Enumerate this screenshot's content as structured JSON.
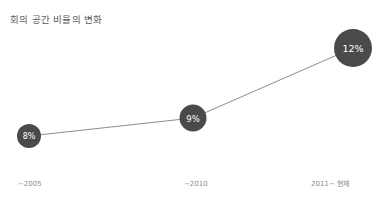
{
  "chart_data": {
    "type": "line",
    "title": "회의 공간 비율의 변화",
    "xlabel": "",
    "ylabel": "",
    "categories": [
      "~2005",
      "~2010",
      "2011~ 현재"
    ],
    "values": [
      8,
      9,
      12
    ],
    "value_labels": [
      "8%",
      "9%",
      "12%"
    ],
    "ylim": [
      0,
      14
    ],
    "grid": false,
    "legend": "none",
    "series": [
      {
        "name": "회의 공간 비율",
        "values": [
          8,
          9,
          12
        ]
      }
    ],
    "marker_style": "filled-circle-sized-by-value",
    "colors": {
      "marker": "#4a4a4a",
      "marker_text": "#ffffff",
      "line": "#8c8c8c",
      "axis": "#d9d9d9",
      "title_text": "#595959",
      "tick_text": "#8a8a8a",
      "background": "#ffffff"
    },
    "points": [
      {
        "label": "~2005",
        "value_label": "8%",
        "value": 8,
        "cx": 29,
        "cy": 136,
        "r": 12
      },
      {
        "label": "~2010",
        "value_label": "9%",
        "value": 9,
        "cx": 193,
        "cy": 118,
        "r": 13.5
      },
      {
        "label": "2011~ 현재",
        "value_label": "12%",
        "value": 12,
        "cx": 353,
        "cy": 48,
        "r": 19
      }
    ],
    "axis_line": {
      "x1": 14,
      "y1": 167,
      "x2": 375,
      "y2": 167
    }
  }
}
